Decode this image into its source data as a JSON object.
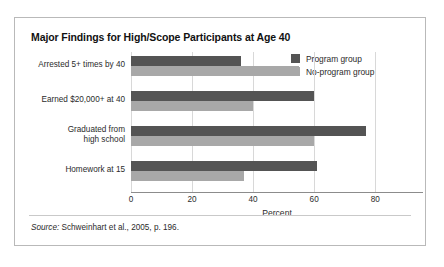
{
  "figure": {
    "title": "Major Findings for High/Scope Participants at Age 40",
    "source_lead": "Source:",
    "source_text": "Schweinhart et al., 2005, p. 196."
  },
  "legend": {
    "position": "top-right",
    "items": [
      {
        "label": "Program group",
        "color": "#545454"
      },
      {
        "label": "No-program group",
        "color": "#a8a8a8"
      }
    ]
  },
  "axis": {
    "x_title": "Percent",
    "ticks": [
      "0",
      "20",
      "40",
      "60",
      "80"
    ]
  },
  "chart_data": {
    "type": "bar",
    "orientation": "horizontal",
    "title": "Major Findings for High/Scope Participants at Age 40",
    "xlabel": "Percent",
    "ylabel": "",
    "xlim": [
      0,
      95
    ],
    "xticks": [
      0,
      20,
      40,
      60,
      80
    ],
    "grid": true,
    "legend_position": "top-right",
    "categories": [
      "Arrested 5+ times by 40",
      "Earned $20,000+ at 40",
      "Graduated from high school",
      "Homework at 15"
    ],
    "category_lines": [
      [
        "Arrested 5+ times by 40"
      ],
      [
        "Earned $20,000+ at 40"
      ],
      [
        "Graduated from",
        "high school"
      ],
      [
        "Homework at 15"
      ]
    ],
    "series": [
      {
        "name": "Program group",
        "color": "#545454",
        "values": [
          36,
          60,
          77,
          61
        ]
      },
      {
        "name": "No-program group",
        "color": "#a8a8a8",
        "values": [
          55,
          40,
          60,
          37
        ]
      }
    ],
    "annotation": "Source: Schweinhart et al., 2005, p. 196."
  }
}
